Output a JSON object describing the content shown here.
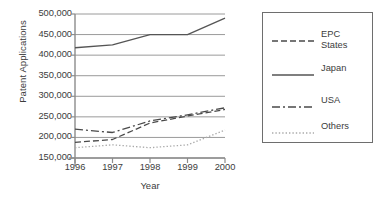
{
  "chart_data": {
    "type": "line",
    "title": "",
    "xlabel": "Year",
    "ylabel": "Patent Applications",
    "x": [
      1996,
      1997,
      1998,
      1999,
      2000
    ],
    "xtick_labels": [
      "1996",
      "1997",
      "1998",
      "1999",
      "2000"
    ],
    "ytick_labels": [
      "500,000",
      "450,000",
      "400,000",
      "350,000",
      "300,000",
      "250,000",
      "200,000",
      "150,000"
    ],
    "ytick_values": [
      500000,
      450000,
      400000,
      350000,
      300000,
      250000,
      200000,
      150000
    ],
    "ylim": [
      150000,
      500000
    ],
    "xlim": [
      1996,
      2000
    ],
    "grid": "horizontal",
    "legend_position": "right-outside",
    "series": [
      {
        "name": "EPC States",
        "legend_label": "EPC\nStates",
        "dash": "dashed",
        "color": "#4a4a4a",
        "values": [
          188000,
          195000,
          235000,
          252000,
          268000
        ]
      },
      {
        "name": "Japan",
        "legend_label": "Japan",
        "dash": "solid",
        "color": "#555555",
        "values": [
          418000,
          425000,
          450000,
          450000,
          490000
        ]
      },
      {
        "name": "USA",
        "legend_label": "USA",
        "dash": "dashdot",
        "color": "#4a4a4a",
        "values": [
          220000,
          212000,
          240000,
          255000,
          272000
        ]
      },
      {
        "name": "Others",
        "legend_label": "Others",
        "dash": "dotted",
        "color": "#aaaaaa",
        "values": [
          175000,
          182000,
          175000,
          182000,
          218000
        ]
      }
    ]
  },
  "axis": {
    "line_color": "#8c8c8c",
    "grid_color": "#9a9a9a"
  }
}
